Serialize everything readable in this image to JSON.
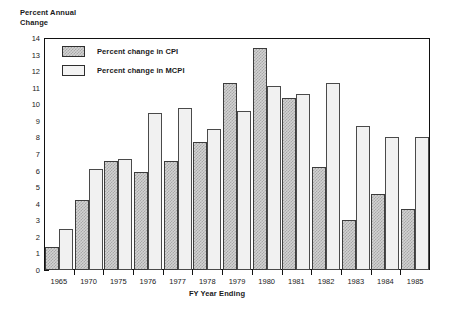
{
  "chart_data": {
    "type": "bar",
    "title": "",
    "ylabel": "Percent Annual\nChange",
    "xlabel": "FY Year Ending",
    "categories": [
      "1965",
      "1970",
      "1975",
      "1976",
      "1977",
      "1978",
      "1979",
      "1980",
      "1981",
      "1982",
      "1983",
      "1984",
      "1985"
    ],
    "series": [
      {
        "name": "Percent change in CPI",
        "values": [
          1.4,
          4.2,
          6.6,
          5.9,
          6.6,
          7.7,
          11.3,
          13.4,
          10.4,
          6.2,
          3.0,
          4.6,
          3.7
        ]
      },
      {
        "name": "Percent change in MCPI",
        "values": [
          2.5,
          6.1,
          6.7,
          9.5,
          9.8,
          8.5,
          9.6,
          11.1,
          10.6,
          11.3,
          8.7,
          8.0,
          8.0
        ]
      }
    ],
    "ylim": [
      0,
      14
    ],
    "yticks": [
      0,
      1,
      2,
      3,
      4,
      5,
      6,
      7,
      8,
      9,
      10,
      11,
      12,
      13,
      14
    ],
    "ytick_labels": [
      "0",
      "1",
      "2",
      "3",
      "4",
      "5",
      "6",
      "7",
      "8",
      "9",
      "10",
      "11",
      "12",
      "13",
      "14"
    ],
    "grid": false,
    "legend_position": "upper-left-inside",
    "colors": {
      "cpi_fill": "#d2d2d2",
      "cpi_hatch": "#a8a8a8",
      "mcpi_fill": "#f1f1f1",
      "border": "#3c3c3c",
      "axis": "#111111"
    }
  },
  "legend": {
    "items": [
      {
        "label": "Percent change in CPI",
        "swatch": "cpi"
      },
      {
        "label": "Percent change in MCPI",
        "swatch": "mcpi"
      }
    ]
  }
}
